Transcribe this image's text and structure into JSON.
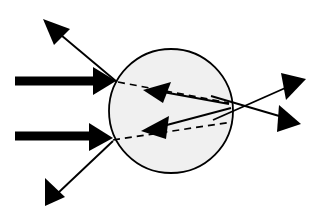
{
  "figure": {
    "width": 328,
    "height": 222,
    "background_color": "#ffffff"
  },
  "colors": {
    "ink": "#000000",
    "sphere_fill": "#f0f0f0",
    "sphere_stroke": "#000000",
    "background": "#ffffff"
  },
  "geometry": {
    "sphere": {
      "cx": 171,
      "cy": 111,
      "r": 62,
      "stroke_width": 1.8
    },
    "incident_beams": [
      {
        "name": "upper-incident-beam",
        "x1": 15,
        "y1": 81,
        "x2": 96,
        "y2": 81,
        "thickness": 9,
        "head": "116,81 93,67 93,95"
      },
      {
        "name": "lower-incident-beam",
        "x1": 15,
        "y1": 136,
        "x2": 92,
        "y2": 136,
        "thickness": 9,
        "head": "113,138 89,123 89,151"
      }
    ],
    "reflected_rays": [
      {
        "name": "upper-left-reflected-ray",
        "x1": 117,
        "y1": 82,
        "x2": 55,
        "y2": 30,
        "head": "43,19 70,29 54,45",
        "stroke_width": 1.9
      },
      {
        "name": "lower-left-reflected-ray",
        "x1": 113,
        "y1": 141,
        "x2": 58,
        "y2": 193,
        "head": "45,206 45,178 65,197",
        "stroke_width": 1.9
      }
    ],
    "transmitted_rays": [
      {
        "name": "upper-right-transmitted-ray",
        "x1": 213,
        "y1": 120,
        "x2": 292,
        "y2": 85,
        "head": "306,79 286,100 281,73",
        "stroke_width": 1.9
      },
      {
        "name": "lower-right-transmitted-ray",
        "x1": 211,
        "y1": 96,
        "x2": 286,
        "y2": 118,
        "head": "301,124 279,105 277,132",
        "stroke_width": 1.9
      }
    ],
    "dashed_rays": [
      {
        "name": "upper-dashed-continuation",
        "x1": 118,
        "y1": 82,
        "x2": 229,
        "y2": 103,
        "stroke_width": 1.7,
        "dash": "7 5"
      },
      {
        "name": "lower-dashed-continuation",
        "x1": 113,
        "y1": 140,
        "x2": 232,
        "y2": 122,
        "stroke_width": 1.7,
        "dash": "7 5"
      }
    ],
    "internal_rays": [
      {
        "name": "upper-internal-ray",
        "x1": 229,
        "y1": 104,
        "x2": 163,
        "y2": 92,
        "head": "143,90 171,82 163,103",
        "stroke_width": 1.9
      },
      {
        "name": "lower-internal-ray",
        "x1": 231,
        "y1": 108,
        "x2": 163,
        "y2": 126,
        "head": "141,131 169,116 166,139",
        "stroke_width": 1.9
      }
    ]
  }
}
